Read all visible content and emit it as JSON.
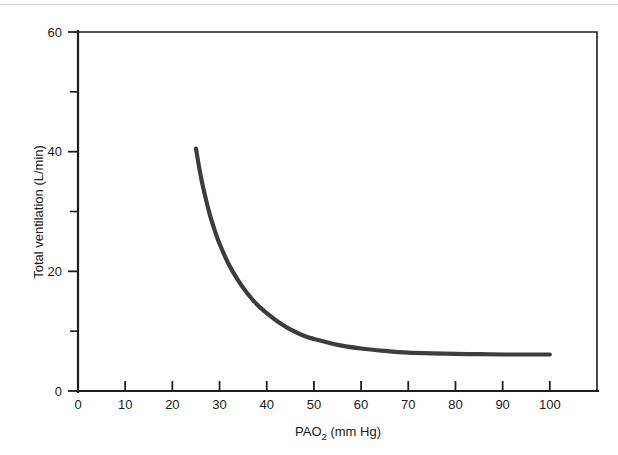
{
  "figure": {
    "background_color": "#ffffff",
    "axis_color": "#1d1d1d",
    "curve_color": "#3d3d3d"
  },
  "chart_data": {
    "type": "line",
    "title": "",
    "subtitle": "",
    "xlabel": "PAO2 (mm Hg)",
    "xlabel_base": "PAO",
    "xlabel_sub": "2",
    "xlabel_units": " (mm Hg)",
    "ylabel": "Total ventilation (L/min)",
    "xlim": [
      0,
      110
    ],
    "ylim": [
      0,
      60
    ],
    "grid": false,
    "legend": null,
    "x_major_ticks": [
      0,
      10,
      20,
      30,
      40,
      50,
      60,
      70,
      80,
      90,
      100
    ],
    "x_tick_labels": [
      "0",
      "10",
      "20",
      "30",
      "40",
      "50",
      "60",
      "70",
      "80",
      "90",
      "100"
    ],
    "y_major_ticks": [
      0,
      20,
      40,
      60
    ],
    "y_tick_labels": [
      "0",
      "20",
      "40",
      "60"
    ],
    "y_minor_ticks": [
      10,
      30,
      50
    ],
    "series": [
      {
        "name": "Hypoxic ventilatory response",
        "x": [
          25,
          26,
          27,
          28,
          29,
          30,
          32,
          34,
          36,
          38,
          40,
          42,
          45,
          48,
          50,
          55,
          60,
          65,
          70,
          75,
          80,
          85,
          90,
          95,
          100
        ],
        "y": [
          40.5,
          36.0,
          32.4,
          29.3,
          26.8,
          24.6,
          21.1,
          18.4,
          16.2,
          14.4,
          13.0,
          11.8,
          10.3,
          9.2,
          8.7,
          7.7,
          7.1,
          6.7,
          6.4,
          6.3,
          6.2,
          6.15,
          6.1,
          6.1,
          6.1
        ]
      }
    ],
    "annotations": []
  }
}
